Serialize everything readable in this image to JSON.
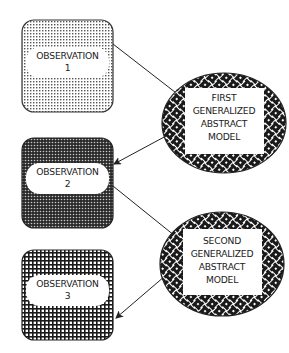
{
  "diagram": {
    "observations": [
      {
        "id": "obs1",
        "line1": "OBSERVATION",
        "line2": "1",
        "pattern": "fine-dots"
      },
      {
        "id": "obs2",
        "line1": "OBSERVATION",
        "line2": "2",
        "pattern": "dense-dots"
      },
      {
        "id": "obs3",
        "line1": "OBSERVATION",
        "line2": "3",
        "pattern": "grid"
      }
    ],
    "models": [
      {
        "id": "model1",
        "lines": [
          "FIRST",
          "GENERALIZED",
          "ABSTRACT",
          "MODEL"
        ],
        "pattern": "woven"
      },
      {
        "id": "model2",
        "lines": [
          "SECOND",
          "GENERALIZED",
          "ABSTRACT",
          "MODEL"
        ],
        "pattern": "woven"
      }
    ],
    "arrows": [
      {
        "from": "obs1",
        "to": "model1"
      },
      {
        "from": "model1",
        "to": "obs2"
      },
      {
        "from": "obs2",
        "to": "model2"
      },
      {
        "from": "model2",
        "to": "obs3"
      }
    ],
    "colors": {
      "ink": "#222222",
      "background": "#ffffff"
    }
  }
}
